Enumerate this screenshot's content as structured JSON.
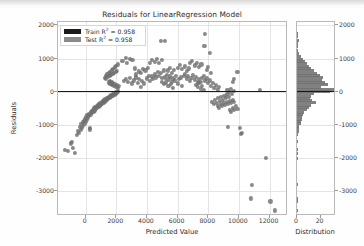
{
  "chart_data": {
    "type": "scatter",
    "title": "Residuals for LinearRegression Model",
    "xlabel": "Predicted Value",
    "ylabel": "Residuals",
    "xlim": [
      -1800,
      13200
    ],
    "ylim": [
      -3750,
      2100
    ],
    "xticks": [
      0,
      2000,
      4000,
      6000,
      8000,
      10000,
      12000
    ],
    "xticklabels": [
      "0",
      "2000",
      "4000",
      "6000",
      "8000",
      "10000",
      "12000"
    ],
    "yticks": [
      2000,
      1000,
      0,
      -1000,
      -2000,
      -3000
    ],
    "yticklabels": [
      "2000",
      "1000",
      "0",
      "-1000",
      "-2000",
      "-3000"
    ],
    "grid": true,
    "legend_position": "upper left",
    "reference_line": {
      "y": 0,
      "color": "#1a1a1a"
    },
    "point_color": "#6f6f6f",
    "legend": [
      {
        "name": "Train R² = 0.958",
        "label_prefix": "Train R",
        "sup": "2",
        "label_suffix": " = 0.958",
        "color": "#1a1a1a"
      },
      {
        "name": "Test R² = 0.958",
        "label_prefix": "Test R",
        "sup": "2",
        "label_suffix": " = 0.958",
        "color": "#8a8a8a"
      }
    ],
    "points": [
      [
        -1350,
        -1750
      ],
      [
        -1150,
        -1800
      ],
      [
        -950,
        -1560
      ],
      [
        -900,
        -1520
      ],
      [
        -820,
        -1700
      ],
      [
        -700,
        -1840
      ],
      [
        -560,
        -1300
      ],
      [
        -500,
        -1180
      ],
      [
        -440,
        -1240
      ],
      [
        -380,
        -1060
      ],
      [
        -330,
        -1150
      ],
      [
        -300,
        -980
      ],
      [
        -250,
        -1080
      ],
      [
        -200,
        -900
      ],
      [
        -160,
        -1020
      ],
      [
        -120,
        -870
      ],
      [
        -80,
        -960
      ],
      [
        -40,
        -820
      ],
      [
        0,
        -900
      ],
      [
        40,
        -760
      ],
      [
        80,
        -840
      ],
      [
        120,
        -700
      ],
      [
        160,
        -790
      ],
      [
        200,
        -660
      ],
      [
        240,
        -730
      ],
      [
        280,
        -1090
      ],
      [
        300,
        -1140
      ],
      [
        330,
        -620
      ],
      [
        360,
        -700
      ],
      [
        400,
        -580
      ],
      [
        440,
        -650
      ],
      [
        480,
        -540
      ],
      [
        520,
        -610
      ],
      [
        560,
        -500
      ],
      [
        600,
        -570
      ],
      [
        640,
        -470
      ],
      [
        680,
        -530
      ],
      [
        720,
        -430
      ],
      [
        760,
        -490
      ],
      [
        800,
        -400
      ],
      [
        840,
        -455
      ],
      [
        880,
        -370
      ],
      [
        920,
        -420
      ],
      [
        960,
        -340
      ],
      [
        1000,
        -390
      ],
      [
        1040,
        -310
      ],
      [
        1080,
        -360
      ],
      [
        1120,
        -285
      ],
      [
        1160,
        -330
      ],
      [
        1200,
        -255
      ],
      [
        1240,
        -300
      ],
      [
        1280,
        -230
      ],
      [
        1320,
        -270
      ],
      [
        1360,
        -205
      ],
      [
        1400,
        -245
      ],
      [
        1440,
        -180
      ],
      [
        1480,
        -215
      ],
      [
        1520,
        -155
      ],
      [
        1560,
        -190
      ],
      [
        1600,
        -130
      ],
      [
        1640,
        -165
      ],
      [
        1680,
        -105
      ],
      [
        1720,
        -140
      ],
      [
        1760,
        -80
      ],
      [
        1800,
        -115
      ],
      [
        1840,
        -60
      ],
      [
        1880,
        -90
      ],
      [
        1920,
        -35
      ],
      [
        1960,
        -65
      ],
      [
        2000,
        -15
      ],
      [
        2040,
        -45
      ],
      [
        2080,
        10
      ],
      [
        2120,
        -20
      ],
      [
        1250,
        420
      ],
      [
        1300,
        480
      ],
      [
        1350,
        380
      ],
      [
        1400,
        520
      ],
      [
        1450,
        440
      ],
      [
        1500,
        560
      ],
      [
        1550,
        470
      ],
      [
        1600,
        600
      ],
      [
        1650,
        500
      ],
      [
        1700,
        640
      ],
      [
        1750,
        530
      ],
      [
        1800,
        690
      ],
      [
        1850,
        560
      ],
      [
        1900,
        730
      ],
      [
        1950,
        590
      ],
      [
        2000,
        780
      ],
      [
        2050,
        620
      ],
      [
        2100,
        820
      ],
      [
        1500,
        280
      ],
      [
        1560,
        330
      ],
      [
        1620,
        240
      ],
      [
        1680,
        290
      ],
      [
        1740,
        200
      ],
      [
        1800,
        250
      ],
      [
        1860,
        180
      ],
      [
        1920,
        220
      ],
      [
        1980,
        150
      ],
      [
        2040,
        190
      ],
      [
        2100,
        120
      ],
      [
        2160,
        160
      ],
      [
        2400,
        930
      ],
      [
        2600,
        1020
      ],
      [
        2700,
        860
      ],
      [
        2900,
        1000
      ],
      [
        3050,
        970
      ],
      [
        3200,
        700
      ],
      [
        2500,
        330
      ],
      [
        2600,
        380
      ],
      [
        2750,
        300
      ],
      [
        2900,
        420
      ],
      [
        3000,
        250
      ],
      [
        3150,
        340
      ],
      [
        3300,
        430
      ],
      [
        3400,
        260
      ],
      [
        3500,
        380
      ],
      [
        3600,
        150
      ],
      [
        3700,
        330
      ],
      [
        3800,
        250
      ],
      [
        3300,
        520
      ],
      [
        3450,
        610
      ],
      [
        3600,
        560
      ],
      [
        3750,
        680
      ],
      [
        3900,
        640
      ],
      [
        4050,
        720
      ],
      [
        4000,
        400
      ],
      [
        4100,
        480
      ],
      [
        4200,
        330
      ],
      [
        4300,
        460
      ],
      [
        4400,
        380
      ],
      [
        4500,
        520
      ],
      [
        4600,
        430
      ],
      [
        4700,
        600
      ],
      [
        4800,
        480
      ],
      [
        4900,
        560
      ],
      [
        5000,
        420
      ],
      [
        5100,
        640
      ],
      [
        4200,
        880
      ],
      [
        4350,
        960
      ],
      [
        4500,
        900
      ],
      [
        4650,
        980
      ],
      [
        4800,
        870
      ],
      [
        5000,
        960
      ],
      [
        4900,
        1530
      ],
      [
        5200,
        1540
      ],
      [
        5350,
        640
      ],
      [
        5500,
        720
      ],
      [
        5600,
        560
      ],
      [
        5750,
        660
      ],
      [
        5200,
        430
      ],
      [
        5300,
        500
      ],
      [
        5400,
        370
      ],
      [
        5500,
        460
      ],
      [
        5600,
        300
      ],
      [
        5700,
        400
      ],
      [
        5800,
        340
      ],
      [
        5900,
        480
      ],
      [
        6000,
        250
      ],
      [
        6100,
        380
      ],
      [
        6200,
        430
      ],
      [
        6300,
        180
      ],
      [
        5000,
        300
      ],
      [
        5100,
        220
      ],
      [
        5250,
        280
      ],
      [
        5400,
        160
      ],
      [
        5550,
        240
      ],
      [
        5700,
        120
      ],
      [
        6000,
        720
      ],
      [
        6150,
        800
      ],
      [
        6300,
        680
      ],
      [
        6450,
        760
      ],
      [
        6600,
        620
      ],
      [
        6750,
        700
      ],
      [
        6400,
        480
      ],
      [
        6500,
        540
      ],
      [
        6600,
        400
      ],
      [
        6700,
        470
      ],
      [
        6800,
        330
      ],
      [
        6900,
        420
      ],
      [
        7000,
        500
      ],
      [
        7100,
        360
      ],
      [
        7200,
        440
      ],
      [
        7300,
        280
      ],
      [
        7400,
        380
      ],
      [
        7500,
        300
      ],
      [
        6800,
        860
      ],
      [
        6950,
        930
      ],
      [
        7100,
        790
      ],
      [
        7250,
        870
      ],
      [
        7400,
        740
      ],
      [
        7550,
        820
      ],
      [
        7200,
        200
      ],
      [
        7300,
        140
      ],
      [
        7400,
        260
      ],
      [
        7500,
        80
      ],
      [
        7600,
        180
      ],
      [
        7700,
        60
      ],
      [
        7800,
        1740
      ],
      [
        7750,
        1390
      ],
      [
        8100,
        1180
      ],
      [
        7900,
        660
      ],
      [
        8000,
        740
      ],
      [
        8150,
        560
      ],
      [
        7600,
        420
      ],
      [
        7700,
        480
      ],
      [
        7800,
        340
      ],
      [
        7900,
        400
      ],
      [
        8000,
        260
      ],
      [
        8100,
        340
      ],
      [
        8200,
        180
      ],
      [
        8300,
        260
      ],
      [
        8400,
        100
      ],
      [
        8500,
        200
      ],
      [
        8600,
        40
      ],
      [
        8700,
        140
      ],
      [
        8250,
        -300
      ],
      [
        8350,
        -380
      ],
      [
        8450,
        -250
      ],
      [
        8550,
        -330
      ],
      [
        8650,
        -200
      ],
      [
        8750,
        -290
      ],
      [
        8850,
        -160
      ],
      [
        8950,
        -240
      ],
      [
        9050,
        -120
      ],
      [
        9150,
        -200
      ],
      [
        9250,
        -80
      ],
      [
        9350,
        -170
      ],
      [
        8600,
        -420
      ],
      [
        8700,
        -480
      ],
      [
        8800,
        -380
      ],
      [
        8900,
        -440
      ],
      [
        9000,
        -350
      ],
      [
        9100,
        -410
      ],
      [
        9200,
        -300
      ],
      [
        9300,
        -370
      ],
      [
        9400,
        -270
      ],
      [
        9500,
        -340
      ],
      [
        9600,
        -240
      ],
      [
        9700,
        -300
      ],
      [
        9400,
        -540
      ],
      [
        9500,
        -600
      ],
      [
        9600,
        -480
      ],
      [
        9700,
        -560
      ],
      [
        9800,
        -440
      ],
      [
        9900,
        -520
      ],
      [
        9250,
        40
      ],
      [
        9350,
        -20
      ],
      [
        9450,
        80
      ],
      [
        9550,
        -60
      ],
      [
        9650,
        20
      ],
      [
        9900,
        590
      ],
      [
        9700,
        380
      ],
      [
        9600,
        300
      ],
      [
        9300,
        -1070
      ],
      [
        10050,
        -1080
      ],
      [
        10200,
        -1240
      ],
      [
        10150,
        -1270
      ],
      [
        11350,
        60
      ],
      [
        11750,
        -1990
      ],
      [
        10850,
        -2800
      ],
      [
        10800,
        -3220
      ],
      [
        12050,
        -3310
      ],
      [
        12350,
        -3580
      ]
    ],
    "histogram": {
      "xlabel": "Distribution",
      "xticks": [
        0,
        20
      ],
      "xticklabels": [
        "0",
        "20"
      ],
      "bar_color": "#6f6f6f",
      "bins": [
        {
          "y": 1750,
          "count": 1
        },
        {
          "y": 1650,
          "count": 1
        },
        {
          "y": 1550,
          "count": 2
        },
        {
          "y": 1450,
          "count": 1
        },
        {
          "y": 1350,
          "count": 1
        },
        {
          "y": 1250,
          "count": 1
        },
        {
          "y": 1150,
          "count": 2
        },
        {
          "y": 1050,
          "count": 3
        },
        {
          "y": 980,
          "count": 5
        },
        {
          "y": 910,
          "count": 7
        },
        {
          "y": 840,
          "count": 8
        },
        {
          "y": 770,
          "count": 10
        },
        {
          "y": 700,
          "count": 12
        },
        {
          "y": 630,
          "count": 14
        },
        {
          "y": 560,
          "count": 17
        },
        {
          "y": 490,
          "count": 19
        },
        {
          "y": 420,
          "count": 22
        },
        {
          "y": 350,
          "count": 21
        },
        {
          "y": 280,
          "count": 24
        },
        {
          "y": 210,
          "count": 26
        },
        {
          "y": 140,
          "count": 20
        },
        {
          "y": 70,
          "count": 31
        },
        {
          "y": 10,
          "count": 28
        },
        {
          "y": -60,
          "count": 14
        },
        {
          "y": -130,
          "count": 12
        },
        {
          "y": -200,
          "count": 11
        },
        {
          "y": -270,
          "count": 13
        },
        {
          "y": -340,
          "count": 16
        },
        {
          "y": -410,
          "count": 12
        },
        {
          "y": -480,
          "count": 10
        },
        {
          "y": -550,
          "count": 8
        },
        {
          "y": -620,
          "count": 6
        },
        {
          "y": -690,
          "count": 5
        },
        {
          "y": -760,
          "count": 4
        },
        {
          "y": -830,
          "count": 4
        },
        {
          "y": -900,
          "count": 3
        },
        {
          "y": -970,
          "count": 3
        },
        {
          "y": -1040,
          "count": 2
        },
        {
          "y": -1110,
          "count": 2
        },
        {
          "y": -1200,
          "count": 2
        },
        {
          "y": -1300,
          "count": 1
        },
        {
          "y": -1500,
          "count": 1
        },
        {
          "y": -1750,
          "count": 1
        },
        {
          "y": -1850,
          "count": 1
        },
        {
          "y": -2000,
          "count": 1
        },
        {
          "y": -2800,
          "count": 1
        },
        {
          "y": -3220,
          "count": 1
        },
        {
          "y": -3320,
          "count": 1
        },
        {
          "y": -3580,
          "count": 1
        }
      ],
      "xmax": 33
    }
  }
}
